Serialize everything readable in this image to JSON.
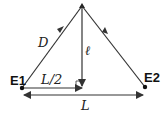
{
  "diagram": {
    "nodes": {
      "e1": {
        "label": "E1",
        "x": 22,
        "y": 88
      },
      "e2": {
        "label": "E2",
        "x": 145,
        "y": 87
      },
      "apex": {
        "x": 82,
        "y": 6
      }
    },
    "labels": {
      "d": "D",
      "ell": "ℓ",
      "half_l": "L/2",
      "l": "L"
    },
    "colors": {
      "line": "#333333",
      "background": "#ffffff"
    }
  }
}
